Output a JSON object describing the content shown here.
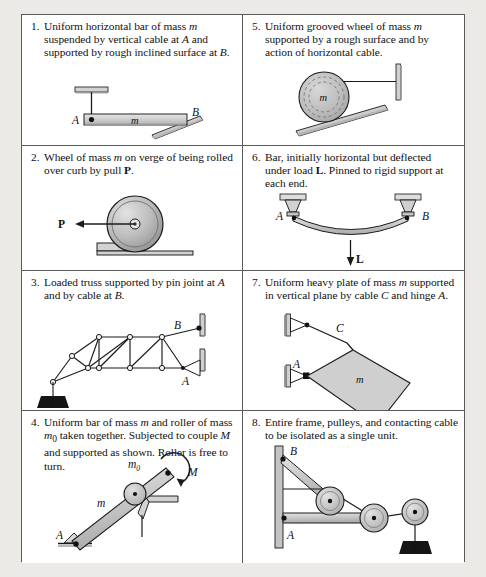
{
  "page": {
    "background_color": "#eceae6",
    "table_border_color": "#5a5a5a",
    "cell_background": "#ffffff"
  },
  "panels": [
    {
      "number": "1.",
      "caption_html": "Uniform horizontal bar of mass <i>m</i> suspended by vertical cable at <i>A</i> and supported by rough inclined surface at <i>B</i>.",
      "labels": {
        "a": "A",
        "b": "B",
        "m": "m"
      },
      "figure": "bar-with-cable-and-incline"
    },
    {
      "number": "2.",
      "caption_html": "Wheel of mass <i>m</i> on verge of being rolled over curb by pull <b>P</b>.",
      "labels": {
        "p": "P"
      },
      "figure": "wheel-over-curb"
    },
    {
      "number": "3.",
      "caption_html": "Loaded truss supported by pin joint at <i>A</i> and by cable at <i>B</i>.",
      "labels": {
        "a": "A",
        "b": "B",
        "load": "L"
      },
      "figure": "loaded-truss"
    },
    {
      "number": "4.",
      "caption_html": "Uniform bar of mass <i>m</i> and roller of mass <i>m</i><sub>0</sub> taken together.  Subjected to couple <i>M</i> and supported as shown.  Roller is free to turn.",
      "labels": {
        "a": "A",
        "m": "m",
        "m0": "m",
        "m0_sub": "0",
        "moment": "M"
      },
      "figure": "bar-roller-couple"
    },
    {
      "number": "5.",
      "caption_html": "Uniform grooved wheel of mass <i>m</i> supported by a rough surface and by action of horizontal cable.",
      "labels": {
        "m": "m"
      },
      "figure": "grooved-wheel"
    },
    {
      "number": "6.",
      "caption_html": "Bar, initially horizontal but deflected under load <b>L</b>.  Pinned to rigid support at each end.",
      "labels": {
        "a": "A",
        "b": "B",
        "load": "L"
      },
      "figure": "deflected-bar"
    },
    {
      "number": "7.",
      "caption_html": "Uniform heavy plate of mass <i>m</i> supported in vertical plane by cable <i>C</i> and hinge <i>A</i>.",
      "labels": {
        "a": "A",
        "c": "C",
        "m": "m"
      },
      "figure": "heavy-plate"
    },
    {
      "number": "8.",
      "caption_html": "Entire frame, pulleys, and contacting cable to be isolated as a single unit.",
      "labels": {
        "a": "A",
        "b": "B",
        "load": "L"
      },
      "figure": "frame-pulleys-cable"
    }
  ],
  "colors": {
    "body_gray": "#c9c9c9",
    "body_gray_light": "#dcdcdc",
    "outline": "#1b1b1b",
    "hatch": "#8c8c8c",
    "load_block": "#151515",
    "shadow": "#b9b9b9"
  }
}
